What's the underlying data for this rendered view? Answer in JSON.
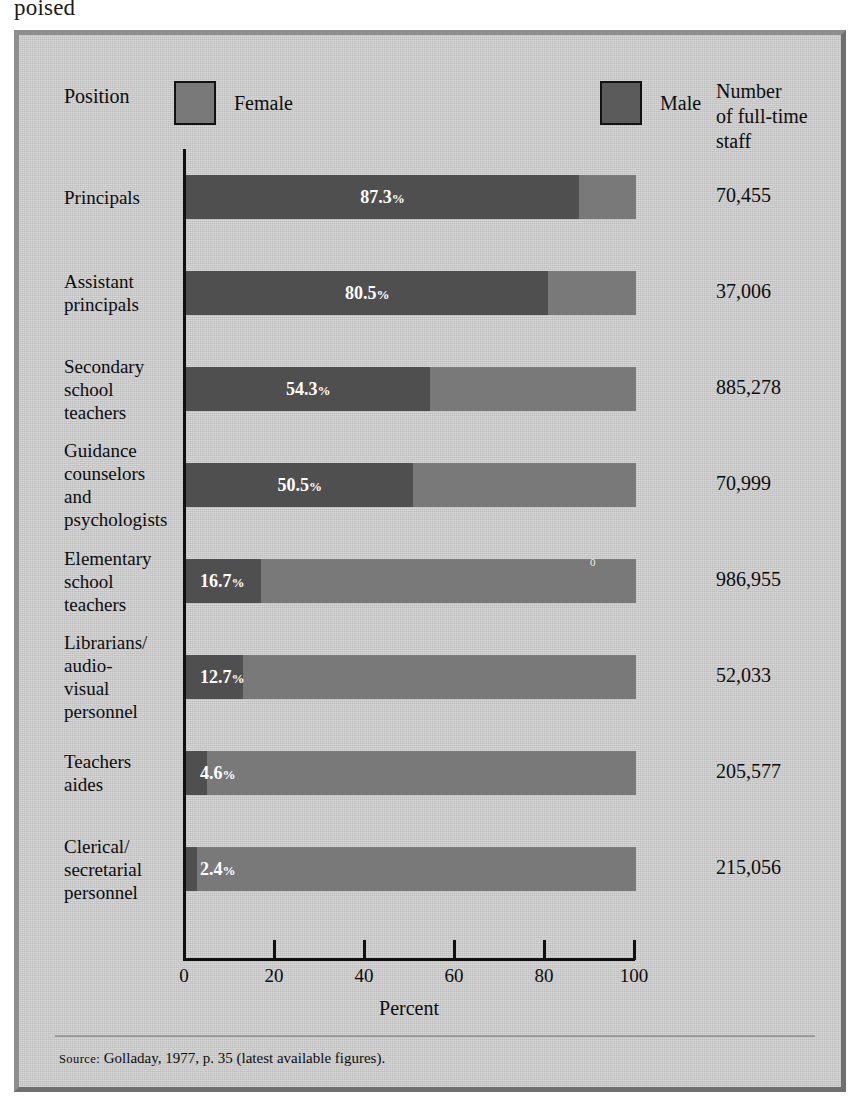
{
  "page_tail_text": "poised",
  "header": {
    "position_label": "Position",
    "legend": [
      {
        "label": "Female",
        "color": "#797979",
        "icon": "legend-swatch-icon"
      },
      {
        "label": "Male",
        "color": "#5b5b5b",
        "icon": "legend-swatch-icon"
      }
    ],
    "count_column_header": "Number of full-time staff",
    "count_column_header_lines": [
      "Number",
      "of full-time",
      "staff"
    ]
  },
  "source": {
    "prefix": "Source",
    "separator": ":",
    "text": "Golladay, 1977, p. 35 (latest available figures)."
  },
  "chart_data": {
    "type": "bar",
    "orientation": "horizontal",
    "stacked": true,
    "title": "",
    "xlabel": "Percent",
    "ylabel": "Position",
    "xlim": [
      0,
      100
    ],
    "xticks": [
      0,
      20,
      40,
      60,
      80,
      100
    ],
    "xticklabels": [
      "0",
      "20",
      "40",
      "60",
      "80",
      "100"
    ],
    "grid": false,
    "legend_position": "top",
    "series": [
      {
        "name": "Male",
        "color": "#4f4f4f",
        "values": [
          87.3,
          80.5,
          54.3,
          50.5,
          16.7,
          12.7,
          4.6,
          2.4
        ]
      },
      {
        "name": "Female",
        "color": "#797979",
        "values": [
          12.7,
          19.5,
          45.7,
          49.5,
          83.3,
          87.3,
          95.4,
          97.6
        ]
      }
    ],
    "categories": [
      "Principals",
      "Assistant principals",
      "Secondary school teachers",
      "Guidance counselors and psychologists",
      "Elementary school teachers",
      "Librarians/audio-visual personnel",
      "Teachers aides",
      "Clerical/secretarial personnel"
    ],
    "rows": [
      {
        "label_lines": [
          "Principals"
        ],
        "male_pct": 87.3,
        "pct_label": "87.3",
        "pct_suffix": "%",
        "count": "70,455"
      },
      {
        "label_lines": [
          "Assistant",
          "principals"
        ],
        "male_pct": 80.5,
        "pct_label": "80.5",
        "pct_suffix": "%",
        "count": "37,006"
      },
      {
        "label_lines": [
          "Secondary",
          "school",
          "teachers"
        ],
        "male_pct": 54.3,
        "pct_label": "54.3",
        "pct_suffix": "%",
        "count": "885,278"
      },
      {
        "label_lines": [
          "Guidance",
          "counselors",
          "and",
          "psychologists"
        ],
        "male_pct": 50.5,
        "pct_label": "50.5",
        "pct_suffix": "%",
        "count": "70,999"
      },
      {
        "label_lines": [
          "Elementary",
          "school",
          "teachers"
        ],
        "male_pct": 16.7,
        "pct_label": "16.7",
        "pct_suffix": "%",
        "count": "986,955",
        "artifact": "0"
      },
      {
        "label_lines": [
          "Librarians/",
          "audio-",
          "visual",
          "personnel"
        ],
        "male_pct": 12.7,
        "pct_label": "12.7",
        "pct_suffix": "%",
        "count": "52,033"
      },
      {
        "label_lines": [
          "Teachers",
          "aides"
        ],
        "male_pct": 4.6,
        "pct_label": "4.6",
        "pct_suffix": "%",
        "count": "205,577"
      },
      {
        "label_lines": [
          "Clerical/",
          "secretarial",
          "personnel"
        ],
        "male_pct": 2.4,
        "pct_label": "2.4",
        "pct_suffix": "%",
        "count": "215,056"
      }
    ]
  }
}
